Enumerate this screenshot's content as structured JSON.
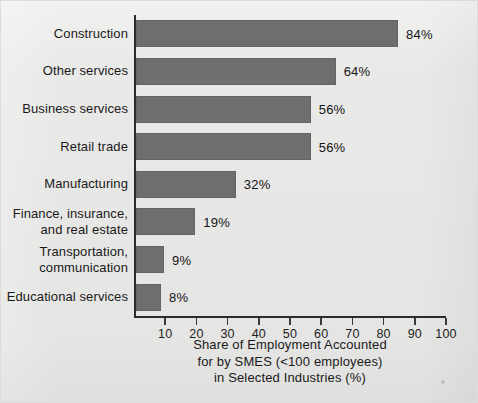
{
  "chart_data": {
    "type": "bar",
    "orientation": "horizontal",
    "title": "",
    "subtitle": "",
    "categories": [
      "Construction",
      "Other services",
      "Business services",
      "Retail trade",
      "Manufacturing",
      "Finance, insurance,\nand real estate",
      "Transportation,\ncommunication",
      "Educational services"
    ],
    "values": [
      84,
      64,
      56,
      56,
      32,
      19,
      9,
      8
    ],
    "value_labels": [
      "84%",
      "64%",
      "56%",
      "56%",
      "32%",
      "19%",
      "9%",
      "8%"
    ],
    "xlabel": "Share of Employment Accounted for by SMES (<100 employees) in Selected Industries (%)",
    "xlabel_lines": [
      "Share of Employment Accounted",
      "for by SMES (<100 employees)",
      "in Selected Industries (%)"
    ],
    "ylabel": "",
    "xlim": [
      0,
      100
    ],
    "xticks": [
      10,
      20,
      30,
      40,
      50,
      60,
      70,
      80,
      90,
      100
    ],
    "xtick_labels": [
      "10",
      "20",
      "30",
      "40",
      "50",
      "60",
      "70",
      "80",
      "90",
      "100"
    ],
    "grid": false,
    "legend": null,
    "colors": {
      "background": "#e9e9e7",
      "bar": "#6e6e6e",
      "axis": "#2b2b2b",
      "text": "#1a1a1a"
    }
  }
}
